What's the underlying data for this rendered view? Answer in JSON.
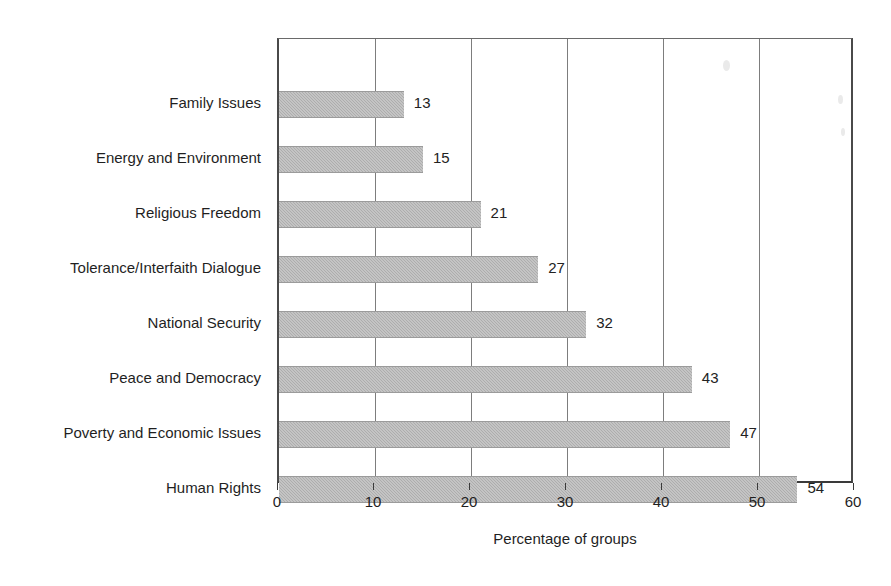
{
  "chart_data": {
    "type": "bar",
    "orientation": "horizontal",
    "title": "",
    "xlabel": "Percentage of groups",
    "ylabel": "",
    "xlim": [
      0,
      60
    ],
    "xticks": [
      0,
      10,
      20,
      30,
      40,
      50,
      60
    ],
    "grid": "vertical-gridlines-at-major-xticks",
    "legend": "none",
    "bar_color": "#adadad",
    "categories": [
      "Family Issues",
      "Energy and Environment",
      "Religious Freedom",
      "Tolerance/Interfaith Dialogue",
      "National Security",
      "Peace and Democracy",
      "Poverty and Economic Issues",
      "Human Rights"
    ],
    "values": [
      13,
      15,
      21,
      27,
      32,
      43,
      47,
      54
    ],
    "value_labels": [
      "13",
      "15",
      "21",
      "27",
      "32",
      "43",
      "47",
      "54"
    ],
    "bars": [
      {
        "category": "Family Issues",
        "value": 13,
        "label": "13"
      },
      {
        "category": "Energy and Environment",
        "value": 15,
        "label": "15"
      },
      {
        "category": "Religious Freedom",
        "value": 21,
        "label": "21"
      },
      {
        "category": "Tolerance/Interfaith Dialogue",
        "value": 27,
        "label": "27"
      },
      {
        "category": "National Security",
        "value": 32,
        "label": "32"
      },
      {
        "category": "Peace and Democracy",
        "value": 43,
        "label": "43"
      },
      {
        "category": "Poverty and Economic Issues",
        "value": 47,
        "label": "47"
      },
      {
        "category": "Human Rights",
        "value": 54,
        "label": "54"
      }
    ],
    "xtick_labels": [
      "0",
      "10",
      "20",
      "30",
      "40",
      "50",
      "60"
    ]
  },
  "layout": {
    "plot_left_px": 277,
    "plot_top_px": 38,
    "plot_width_px": 576,
    "plot_height_px": 445,
    "px_per_unit": 9.6,
    "bar_height_px": 27,
    "row_pitch_px": 55,
    "first_row_center_px": 65
  }
}
